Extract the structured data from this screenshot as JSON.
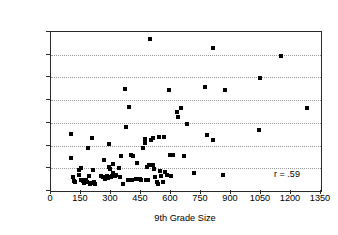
{
  "chart_data": {
    "type": "scatter",
    "title": "",
    "xlabel": "9th Grade Size",
    "ylabel": "Mid-Size City 9th Grade Dropout Rate (%)",
    "xlim": [
      0,
      1350
    ],
    "ylim": [
      0,
      14
    ],
    "xticks": [
      0,
      150,
      300,
      450,
      600,
      750,
      900,
      1050,
      1200,
      1350
    ],
    "yticks": [
      0,
      2,
      4,
      6,
      8,
      10,
      12,
      14
    ],
    "xtick_labels": [
      "0",
      "150",
      "300",
      "450",
      "600",
      "750",
      "900",
      "1050",
      "1200",
      "1350"
    ],
    "ytick_labels": [
      "0",
      "2",
      "4",
      "6",
      "8",
      "10",
      "12",
      "14"
    ],
    "grid": "horizontal-dotted",
    "legend": "none",
    "marker": "filled-square",
    "marker_color": "#000000",
    "annotations": [
      {
        "text": "r = .59",
        "x": 1180,
        "y": 1.45
      }
    ],
    "correlation": ".59",
    "points": [
      [
        100,
        5.0
      ],
      [
        100,
        2.9
      ],
      [
        112,
        1.2
      ],
      [
        115,
        0.9
      ],
      [
        120,
        0.8
      ],
      [
        138,
        1.85
      ],
      [
        142,
        1.45
      ],
      [
        148,
        2.05
      ],
      [
        152,
        0.95
      ],
      [
        158,
        0.85
      ],
      [
        163,
        0.7
      ],
      [
        172,
        1.0
      ],
      [
        176,
        0.95
      ],
      [
        182,
        0.75
      ],
      [
        186,
        3.75
      ],
      [
        192,
        1.3
      ],
      [
        196,
        0.65
      ],
      [
        200,
        0.7
      ],
      [
        205,
        4.65
      ],
      [
        210,
        1.85
      ],
      [
        215,
        0.8
      ],
      [
        222,
        0.62
      ],
      [
        252,
        1.35
      ],
      [
        258,
        1.2
      ],
      [
        266,
        2.7
      ],
      [
        272,
        1.1
      ],
      [
        278,
        1.3
      ],
      [
        284,
        1.15
      ],
      [
        290,
        2.15
      ],
      [
        292,
        4.1
      ],
      [
        296,
        1.95
      ],
      [
        300,
        1.25
      ],
      [
        304,
        1.3
      ],
      [
        308,
        1.6
      ],
      [
        312,
        2.35
      ],
      [
        318,
        1.35
      ],
      [
        326,
        1.45
      ],
      [
        340,
        2.05
      ],
      [
        346,
        1.2
      ],
      [
        352,
        3.05
      ],
      [
        362,
        0.6
      ],
      [
        368,
        8.98
      ],
      [
        374,
        5.6
      ],
      [
        384,
        1.0
      ],
      [
        392,
        7.42
      ],
      [
        398,
        3.2
      ],
      [
        404,
        1.0
      ],
      [
        412,
        3.05
      ],
      [
        424,
        1.05
      ],
      [
        432,
        2.45
      ],
      [
        444,
        1.05
      ],
      [
        452,
        0.95
      ],
      [
        462,
        3.8
      ],
      [
        468,
        4.55
      ],
      [
        472,
        4.2
      ],
      [
        476,
        0.95
      ],
      [
        482,
        2.15
      ],
      [
        486,
        0.95
      ],
      [
        492,
        2.3
      ],
      [
        496,
        13.35
      ],
      [
        502,
        4.45
      ],
      [
        508,
        4.7
      ],
      [
        512,
        2.25
      ],
      [
        516,
        1.9
      ],
      [
        522,
        1.25
      ],
      [
        528,
        0.75
      ],
      [
        534,
        0.65
      ],
      [
        540,
        4.75
      ],
      [
        546,
        1.75
      ],
      [
        552,
        1.35
      ],
      [
        558,
        0.75
      ],
      [
        566,
        4.75
      ],
      [
        572,
        1.7
      ],
      [
        578,
        1.4
      ],
      [
        588,
        8.88
      ],
      [
        596,
        3.15
      ],
      [
        602,
        1.3
      ],
      [
        612,
        3.15
      ],
      [
        628,
        6.95
      ],
      [
        634,
        6.55
      ],
      [
        648,
        7.32
      ],
      [
        664,
        3.05
      ],
      [
        678,
        5.9
      ],
      [
        716,
        1.6
      ],
      [
        772,
        9.18
      ],
      [
        778,
        4.9
      ],
      [
        808,
        12.58
      ],
      [
        812,
        4.5
      ],
      [
        860,
        1.45
      ],
      [
        872,
        8.88
      ],
      [
        1038,
        5.35
      ],
      [
        1046,
        9.98
      ],
      [
        1148,
        11.9
      ],
      [
        1282,
        7.32
      ]
    ]
  }
}
